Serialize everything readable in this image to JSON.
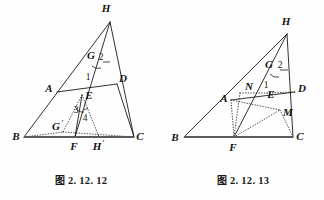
{
  "page": {
    "kind": "geometry-figure-pair",
    "background_color": "#fefefe",
    "ink_color": "#1a1a1a",
    "width": 324,
    "height": 200
  },
  "figures": [
    {
      "id": "fig-2-12-12",
      "caption_cjk": "图",
      "caption_number": "2. 12. 12",
      "caption_full": "图 2. 12. 12",
      "vertex_labels": {
        "H": "H",
        "G": "G",
        "A": "A",
        "D": "D",
        "E": "E",
        "B": "B",
        "C": "C",
        "F": "F",
        "Gp": "G",
        "Gp_prime": "'",
        "Hp": "H",
        "Hp_prime": "'"
      },
      "angle_labels": {
        "one": "1",
        "two": "2",
        "three": "3",
        "four": "4"
      },
      "points": {
        "H": [
          110,
          22
        ],
        "B": [
          24,
          137
        ],
        "C": [
          134,
          137
        ],
        "G": [
          97,
          58
        ],
        "A": [
          57,
          92
        ],
        "D": [
          117,
          84
        ],
        "E": [
          82,
          95
        ],
        "F": [
          75,
          137
        ],
        "Gp": [
          63,
          132
        ],
        "Hp": [
          99,
          137
        ]
      },
      "solid_segments": [
        [
          "H",
          "B"
        ],
        [
          "H",
          "C"
        ],
        [
          "H",
          "F"
        ],
        [
          "A",
          "D"
        ],
        [
          "E",
          "F"
        ],
        [
          "D",
          "C"
        ]
      ],
      "dotted_segments": [
        [
          "E",
          "Gp"
        ],
        [
          "E",
          "Hp"
        ],
        [
          "B",
          "Gp"
        ],
        [
          "Gp",
          "F"
        ],
        [
          "F",
          "Hp"
        ],
        [
          "Hp",
          "C"
        ],
        [
          "Gp",
          "C"
        ]
      ],
      "base_segment": [
        "B",
        "C"
      ]
    },
    {
      "id": "fig-2-12-13",
      "caption_cjk": "图",
      "caption_number": "2. 12. 13",
      "caption_full": "图 2. 12. 13",
      "vertex_labels": {
        "H": "H",
        "G": "G",
        "N": "N",
        "A": "A",
        "E": "E",
        "D": "D",
        "M": "M",
        "B": "B",
        "F": "F",
        "C": "C"
      },
      "angle_labels": {
        "one": "1",
        "two": "2"
      },
      "points": {
        "H": [
          125,
          34
        ],
        "B": [
          22,
          137
        ],
        "C": [
          131,
          137
        ],
        "G": [
          113,
          66
        ],
        "A": [
          69,
          100
        ],
        "N": [
          78,
          93
        ],
        "E": [
          105,
          93
        ],
        "D": [
          133,
          92
        ],
        "M": [
          118,
          110
        ],
        "F": [
          72,
          137
        ]
      },
      "solid_segments": [
        [
          "H",
          "B"
        ],
        [
          "H",
          "C"
        ],
        [
          "H",
          "F"
        ],
        [
          "A",
          "D"
        ],
        [
          "D",
          "C"
        ]
      ],
      "dotted_segments": [
        [
          "N",
          "E"
        ],
        [
          "E",
          "D"
        ],
        [
          "A",
          "M"
        ],
        [
          "A",
          "F"
        ],
        [
          "F",
          "M"
        ],
        [
          "N",
          "F"
        ],
        [
          "M",
          "C"
        ],
        [
          "F",
          "E"
        ]
      ],
      "base_segment": [
        "B",
        "C"
      ]
    }
  ]
}
